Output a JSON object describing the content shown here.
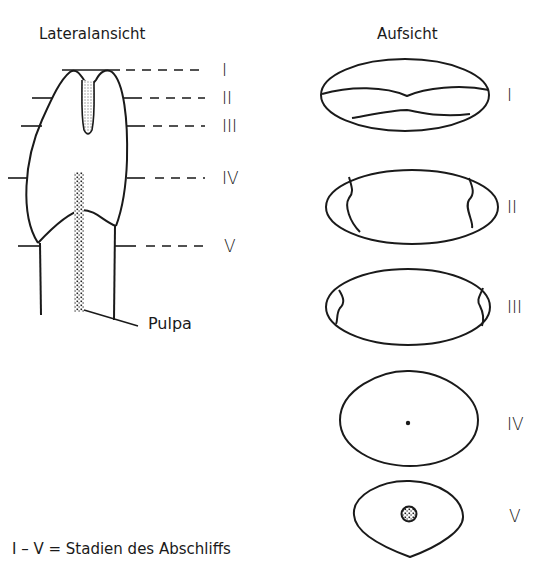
{
  "titles": {
    "left": "Lateralansicht",
    "right": "Aufsicht"
  },
  "lateral": {
    "levels": [
      {
        "label": "I",
        "y": 70
      },
      {
        "label": "II",
        "y": 98
      },
      {
        "label": "III",
        "y": 126
      },
      {
        "label": "IV",
        "y": 178
      },
      {
        "label": "V",
        "y": 246
      }
    ],
    "pulp_label": "Pulpa"
  },
  "top_views": [
    {
      "label": "I"
    },
    {
      "label": "II"
    },
    {
      "label": "III"
    },
    {
      "label": "IV"
    },
    {
      "label": "V"
    }
  ],
  "caption": "I – V = Stadien des Abschliffs",
  "colors": {
    "line": "#1a1a1a",
    "background": "#ffffff",
    "stipple": "#bdbdbd"
  }
}
